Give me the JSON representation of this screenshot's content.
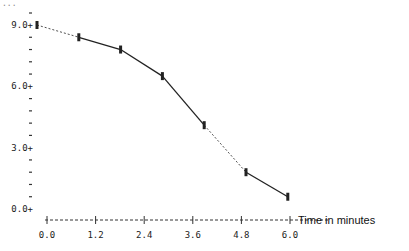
{
  "chart_data": {
    "type": "line",
    "title": "",
    "xlabel": "Time in minutes",
    "ylabel": "",
    "x_ticks": [
      "0.0",
      "1.2",
      "2.4",
      "3.6",
      "4.8",
      "6.0"
    ],
    "y_ticks": [
      "0.0",
      "3.0",
      "6.0",
      "9.0"
    ],
    "xlim": [
      0,
      6.0
    ],
    "ylim": [
      0,
      9.0
    ],
    "grid": false,
    "legend": null,
    "series": [
      {
        "name": "measurement",
        "x": [
          0.0,
          1.0,
          2.0,
          3.0,
          4.0,
          5.0,
          6.0
        ],
        "values": [
          9.0,
          8.4,
          7.8,
          6.5,
          4.1,
          1.8,
          0.6
        ]
      }
    ],
    "colors": {
      "line": "#222222",
      "axis": "#333333"
    }
  },
  "labels": {
    "x_axis_title": "Time in minutes",
    "top_fragment": "..."
  }
}
